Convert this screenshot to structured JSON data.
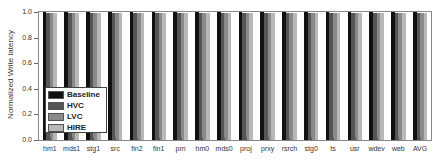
{
  "chart_data": {
    "type": "bar",
    "title": "",
    "xlabel": "",
    "ylabel": "Normalized Write latency",
    "ylim": [
      0.0,
      1.0
    ],
    "yticks": [
      "0.0",
      "0.2",
      "0.4",
      "0.6",
      "0.8",
      "1.0"
    ],
    "grid": false,
    "legend_position": "lower-left inside",
    "categories": [
      "hm1",
      "mds1",
      "stg1",
      "src",
      "fin2",
      "fin1",
      "prn",
      "hm0",
      "mds0",
      "proj",
      "prxy",
      "rsrch",
      "stg0",
      "ts",
      "usr",
      "wdev",
      "web",
      "AVG"
    ],
    "series": [
      {
        "name": "Baseline",
        "color": "#111111",
        "values": [
          1.0,
          1.0,
          1.0,
          1.0,
          1.0,
          1.0,
          1.0,
          1.0,
          1.0,
          1.0,
          1.0,
          1.0,
          1.0,
          1.0,
          1.0,
          1.0,
          1.0,
          1.0
        ]
      },
      {
        "name": "HVC",
        "color": "#555555",
        "values": [
          0.99,
          0.99,
          0.99,
          0.99,
          0.99,
          0.99,
          0.99,
          0.99,
          0.99,
          0.99,
          0.99,
          0.99,
          0.99,
          0.99,
          0.99,
          0.99,
          0.99,
          0.99
        ]
      },
      {
        "name": "LVC",
        "color": "#8a8a8a",
        "values": [
          0.99,
          0.99,
          0.99,
          0.99,
          0.99,
          0.99,
          0.99,
          0.99,
          0.99,
          0.99,
          0.99,
          0.99,
          0.99,
          0.99,
          0.99,
          0.99,
          0.99,
          0.99
        ]
      },
      {
        "name": "HIRE",
        "color": "#b8b8b8",
        "values": [
          0.99,
          0.99,
          0.99,
          0.99,
          0.99,
          0.99,
          0.99,
          0.99,
          0.99,
          0.99,
          0.99,
          0.99,
          0.99,
          0.99,
          0.99,
          0.99,
          0.99,
          0.99
        ]
      }
    ]
  }
}
